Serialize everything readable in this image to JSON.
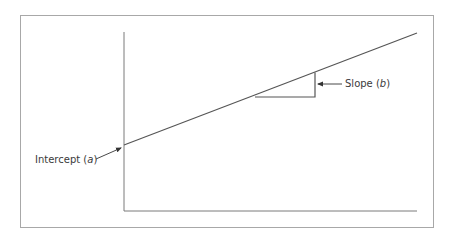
{
  "diagram": {
    "type": "linear-regression-line",
    "labels": {
      "intercept_prefix": "Intercept (",
      "intercept_var": "a",
      "intercept_suffix": ")",
      "slope_prefix": "Slope (",
      "slope_var": "b",
      "slope_suffix": ")"
    },
    "colors": {
      "frame": "#a8a8a8",
      "axis": "#7a7a7a",
      "line": "#555555",
      "text": "#3a3a3a"
    }
  }
}
